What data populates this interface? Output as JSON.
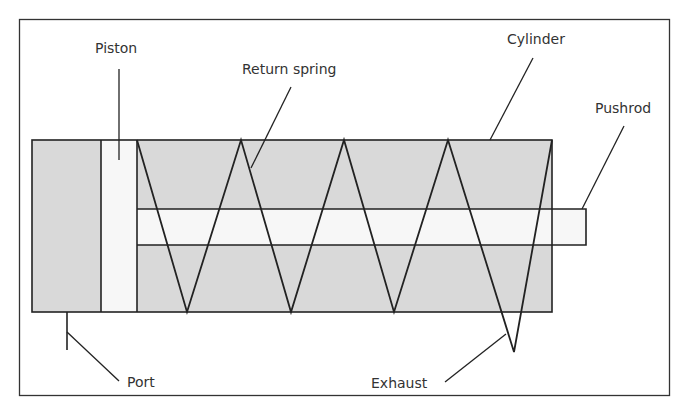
{
  "figure": {
    "type": "pneumatic cylinder cross-section",
    "colors": {
      "outline": "#222222",
      "fill": "#d9d9d9",
      "open": "#f7f7f7",
      "text": "#333333",
      "background": "#ffffff"
    }
  },
  "labels": {
    "piston": "Piston",
    "return_spring": "Return spring",
    "cylinder": "Cylinder",
    "pushrod": "Pushrod",
    "port": "Port",
    "exhaust": "Exhaust"
  }
}
